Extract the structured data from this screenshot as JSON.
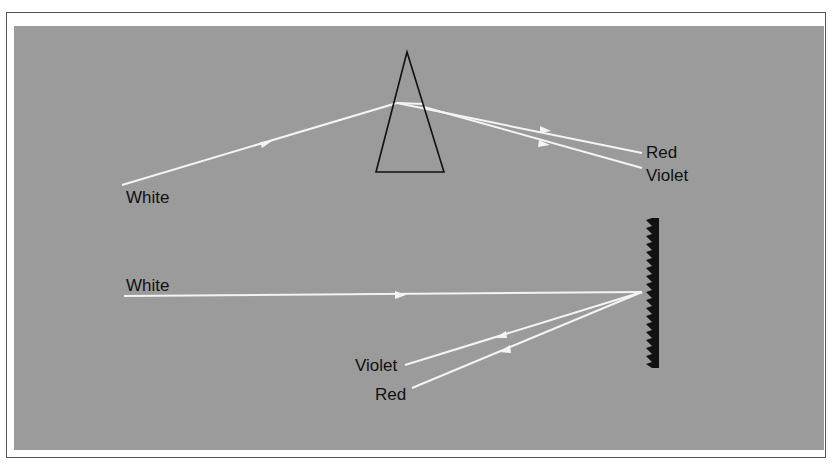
{
  "diagram": {
    "colors": {
      "background": "#9b9b9b",
      "ray": "#f4f4f4",
      "outline": "#111111",
      "grating": "#111111",
      "frame": "#555555"
    },
    "top_section": {
      "name": "prism-dispersion",
      "incident_label": "White",
      "output_labels": [
        "Red",
        "Violet"
      ],
      "prism": {
        "apex": [
          407,
          52
        ],
        "base_left": [
          376,
          172
        ],
        "base_right": [
          444,
          172
        ]
      }
    },
    "bottom_section": {
      "name": "grating-dispersion",
      "incident_label": "White",
      "output_labels": [
        "Violet",
        "Red"
      ],
      "grating": {
        "x": 650,
        "top": 218,
        "bottom": 368
      }
    }
  },
  "labels": {
    "top_white": "White",
    "top_red": "Red",
    "top_violet": "Violet",
    "bottom_white": "White",
    "bottom_violet": "Violet",
    "bottom_red": "Red"
  }
}
